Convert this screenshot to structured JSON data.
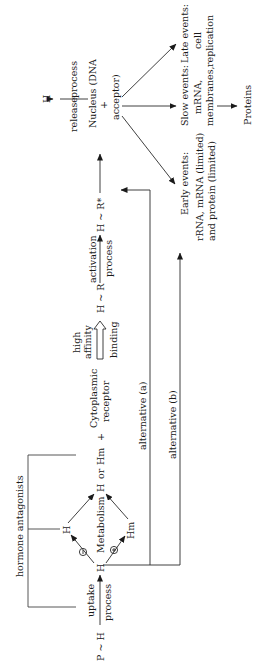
{
  "diagram": {
    "orientation": "rotated 90 degrees counter-clockwise",
    "nodes": {
      "precursor": "P ~ H",
      "uptake_top": "uptake",
      "uptake_bottom": "process",
      "hormone": "H",
      "hormone_upper": "H",
      "metabolite": "Hm",
      "metabolism": "Metabolism",
      "h_or_hm_h": "H",
      "h_or_hm_or": "or",
      "h_or_hm_hm": "Hm",
      "plus1": "+",
      "cytoplasmic_line1": "Cytoplasmic",
      "cytoplasmic_line2": "receptor",
      "binding_top1": "high",
      "binding_top2": "affinity",
      "binding_bottom": "binding",
      "complex": "H ~ R",
      "activation_top": "activation",
      "activation_bottom": "process",
      "activated_complex": "H ~ R*",
      "release_left": "release",
      "release_right": "process",
      "released_hormone": "H",
      "nucleus_line1": "Nucleus (DNA",
      "nucleus_plus": "+",
      "nucleus_line2": "acceptor)",
      "minus_symbol": "−",
      "plus_symbol": "+",
      "antagonists": "hormone antagonists",
      "alternative_a": "alternative (a)",
      "alternative_b": "alternative (b)",
      "early_line1": "Early events:",
      "early_line2": "rRNA, mRNA (limited)",
      "early_line3": "and protein (limited)",
      "slow_line1": "Slow events:",
      "slow_line2": "mRNA,",
      "slow_line3": "membranes,",
      "late_line1": "Late events:",
      "late_line2": "cell",
      "late_line3": "replication",
      "proteins": "Proteins"
    },
    "edges": [
      {
        "from": "P ~ H",
        "to": "H",
        "label": "uptake process"
      },
      {
        "from": "H",
        "to": "H (upper)",
        "label": "−"
      },
      {
        "from": "H",
        "to": "Hm",
        "label": "+"
      },
      {
        "from": "H (upper)",
        "to": "H or Hm"
      },
      {
        "from": "Hm",
        "to": "H or Hm"
      },
      {
        "from": "Cytoplasmic receptor",
        "to": "H ~ R",
        "label": "high affinity binding"
      },
      {
        "from": "H ~ R",
        "to": "H ~ R*",
        "label": "activation process"
      },
      {
        "from": "H ~ R*",
        "to": "Nucleus (DNA + acceptor)"
      },
      {
        "from": "Nucleus (DNA + acceptor)",
        "to": "H",
        "label": "release process"
      },
      {
        "from": "Nucleus (DNA + acceptor)",
        "to": "Early events"
      },
      {
        "from": "Nucleus (DNA + acceptor)",
        "to": "Slow events"
      },
      {
        "from": "Nucleus (DNA + acceptor)",
        "to": "Late events"
      },
      {
        "from": "Slow events",
        "to": "Proteins"
      },
      {
        "from": "H",
        "to": "Nucleus (DNA + acceptor)",
        "label": "alternative (a)"
      },
      {
        "from": "H",
        "to": "Early events",
        "label": "alternative (b)"
      }
    ]
  }
}
